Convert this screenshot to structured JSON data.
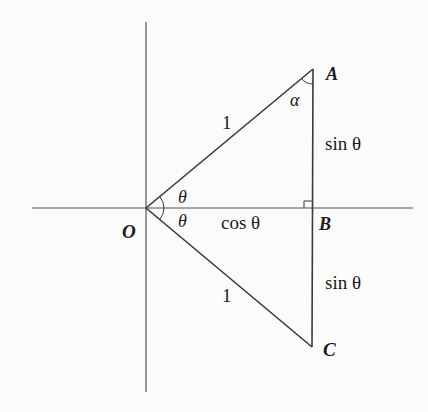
{
  "diagram": {
    "type": "geometry",
    "colors": {
      "stroke": "#3a3a3a",
      "text": "#1a1a1a",
      "background": "#fbfbfa"
    },
    "points": {
      "O": {
        "label": "O"
      },
      "A": {
        "label": "A"
      },
      "B": {
        "label": "B"
      },
      "C": {
        "label": "C"
      }
    },
    "segments": {
      "OA": {
        "label": "1"
      },
      "OC": {
        "label": "1"
      },
      "OB": {
        "label": "cos θ"
      },
      "AB": {
        "label": "sin θ"
      },
      "BC": {
        "label": "sin θ"
      }
    },
    "angles": {
      "AOB": {
        "label": "θ"
      },
      "BOC": {
        "label": "θ"
      },
      "OAB": {
        "label": "α"
      }
    },
    "right_angle_marker": "B"
  }
}
